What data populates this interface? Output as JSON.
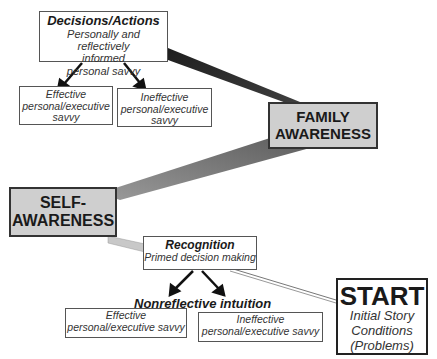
{
  "diagram": {
    "decisions": {
      "title": "Decisions/Actions",
      "line1": "Personally and reflectively",
      "line2": "informed",
      "line3": "personal savvy",
      "effective": [
        "Effective",
        "personal/executive",
        "savvy"
      ],
      "ineffective": [
        "Ineffective",
        "personal/executive",
        "savvy"
      ]
    },
    "family_awareness": [
      "FAMILY",
      "AWARENESS"
    ],
    "self_awareness": [
      "SELF-",
      "AWARENESS"
    ],
    "recognition": {
      "title": "Recognition",
      "subtitle": "Primed decision making"
    },
    "nonreflective": {
      "label": "Nonreflective intuition",
      "effective": [
        "Effective",
        "personal/executive savvy"
      ],
      "ineffective": [
        "Ineffective",
        "personal/executive savvy"
      ]
    },
    "start": {
      "title": "START",
      "lines": [
        "Initial Story",
        "Conditions",
        "(Problems)"
      ]
    },
    "colors": {
      "dark_band": "#2e2e2e",
      "mid_band": "#7a7a7a",
      "light_band": "#c8c8c8",
      "awareness_fill": "#cfcfcf"
    }
  }
}
